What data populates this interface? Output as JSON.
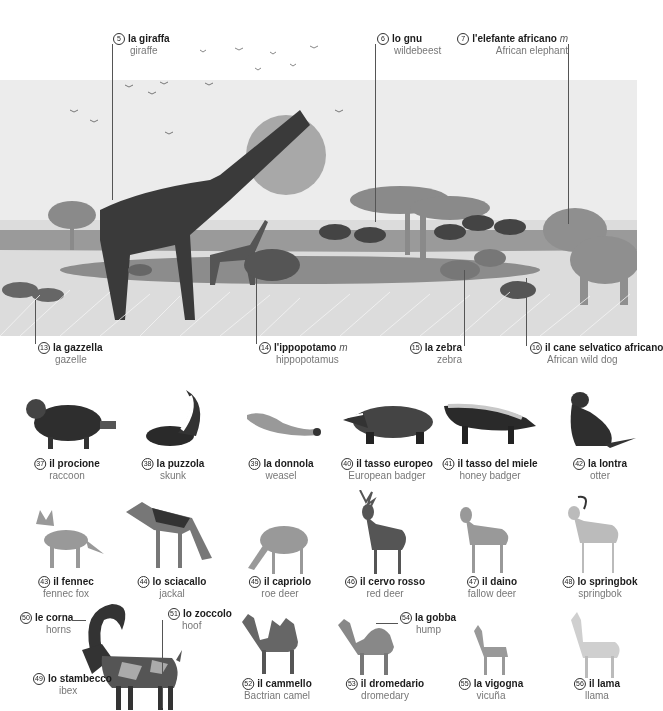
{
  "savanna": {
    "top_labels": [
      {
        "num": "5",
        "it": "la giraffa",
        "en": "giraffe",
        "gender": ""
      },
      {
        "num": "6",
        "it": "lo gnu",
        "en": "wildebeest",
        "gender": ""
      },
      {
        "num": "7",
        "it": "l'elefante africano",
        "en": "African elephant",
        "gender": "m"
      }
    ],
    "bottom_labels": [
      {
        "num": "13",
        "it": "la gazzella",
        "en": "gazelle",
        "gender": ""
      },
      {
        "num": "14",
        "it": "l'ippopotamo",
        "en": "hippopotamus",
        "gender": "m"
      },
      {
        "num": "15",
        "it": "la zebra",
        "en": "zebra",
        "gender": ""
      },
      {
        "num": "16",
        "it": "il cane selvatico africano",
        "en": "African wild dog",
        "gender": ""
      }
    ]
  },
  "row1": [
    {
      "num": "37",
      "it": "il procione",
      "en": "raccoon"
    },
    {
      "num": "38",
      "it": "la puzzola",
      "en": "skunk"
    },
    {
      "num": "39",
      "it": "la donnola",
      "en": "weasel"
    },
    {
      "num": "40",
      "it": "il tasso europeo",
      "en": "European badger"
    },
    {
      "num": "41",
      "it": "il tasso del miele",
      "en": "honey badger"
    },
    {
      "num": "42",
      "it": "la lontra",
      "en": "otter"
    }
  ],
  "row2": [
    {
      "num": "43",
      "it": "il fennec",
      "en": "fennec fox"
    },
    {
      "num": "44",
      "it": "lo sciacallo",
      "en": "jackal"
    },
    {
      "num": "45",
      "it": "il capriolo",
      "en": "roe deer"
    },
    {
      "num": "46",
      "it": "il cervo rosso",
      "en": "red deer"
    },
    {
      "num": "47",
      "it": "il daino",
      "en": "fallow deer"
    },
    {
      "num": "48",
      "it": "lo springbok",
      "en": "springbok"
    }
  ],
  "row3": {
    "ibex": {
      "num": "49",
      "it": "lo stambecco",
      "en": "ibex"
    },
    "horns": {
      "num": "50",
      "it": "le corna",
      "en": "horns"
    },
    "hoof": {
      "num": "51",
      "it": "lo zoccolo",
      "en": "hoof"
    },
    "animals": [
      {
        "num": "52",
        "it": "il cammello",
        "en": "Bactrian camel"
      },
      {
        "num": "53",
        "it": "il dromedario",
        "en": "dromedary"
      },
      {
        "num": "55",
        "it": "la vigogna",
        "en": "vicuña"
      },
      {
        "num": "56",
        "it": "il lama",
        "en": "llama"
      }
    ],
    "hump": {
      "num": "54",
      "it": "la gobba",
      "en": "hump"
    }
  }
}
